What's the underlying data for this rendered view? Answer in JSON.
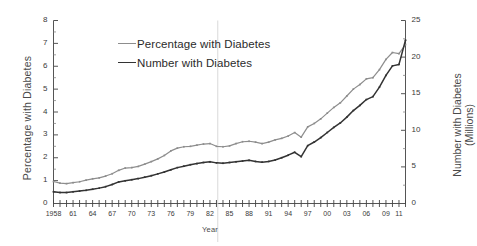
{
  "chart_data": {
    "type": "line",
    "title": "",
    "xlabel": "Year",
    "ylabel": "Percentage with Diabetes",
    "ylabel_right_line1": "Number with Diabetes",
    "ylabel_right_line2": "(Millions)",
    "ylim": [
      0,
      8
    ],
    "ylim_right": [
      0,
      25
    ],
    "xlim": [
      1958,
      2012
    ],
    "grid": false,
    "legend_position": "top-center",
    "y_ticks": [
      0,
      1,
      2,
      3,
      4,
      5,
      6,
      7,
      8
    ],
    "y_ticks_right": [
      0,
      5,
      10,
      15,
      20,
      25
    ],
    "x_tick_labels": [
      "1958",
      "61",
      "64",
      "67",
      "70",
      "73",
      "76",
      "79",
      "82",
      "85",
      "88",
      "91",
      "94",
      "97",
      "00",
      "03",
      "06",
      "09",
      "11"
    ],
    "x_tick_years": [
      1958,
      1961,
      1964,
      1967,
      1970,
      1973,
      1976,
      1979,
      1982,
      1985,
      1988,
      1991,
      1994,
      1997,
      2000,
      2003,
      2006,
      2009,
      2011
    ],
    "x": [
      1958,
      1959,
      1960,
      1961,
      1962,
      1963,
      1964,
      1965,
      1966,
      1967,
      1968,
      1969,
      1970,
      1971,
      1972,
      1973,
      1974,
      1975,
      1976,
      1977,
      1978,
      1979,
      1980,
      1981,
      1982,
      1983,
      1984,
      1985,
      1986,
      1987,
      1988,
      1989,
      1990,
      1991,
      1992,
      1993,
      1994,
      1995,
      1996,
      1997,
      1998,
      1999,
      2000,
      2001,
      2002,
      2003,
      2004,
      2005,
      2006,
      2007,
      2008,
      2009,
      2010,
      2011,
      2012
    ],
    "series": [
      {
        "name": "Percentage with Diabetes",
        "axis": "left",
        "units": "percent",
        "color": "#8d8d8d",
        "style": "line-with-markers",
        "values": [
          0.96,
          0.89,
          0.87,
          0.91,
          0.95,
          1.02,
          1.08,
          1.12,
          1.2,
          1.3,
          1.45,
          1.55,
          1.57,
          1.62,
          1.72,
          1.83,
          1.95,
          2.1,
          2.3,
          2.42,
          2.48,
          2.5,
          2.55,
          2.6,
          2.62,
          2.5,
          2.48,
          2.52,
          2.62,
          2.7,
          2.72,
          2.68,
          2.62,
          2.68,
          2.78,
          2.85,
          2.95,
          3.1,
          2.9,
          3.35,
          3.5,
          3.7,
          3.95,
          4.2,
          4.4,
          4.7,
          5.0,
          5.2,
          5.45,
          5.5,
          5.85,
          6.3,
          6.6,
          6.55,
          6.95
        ]
      },
      {
        "name": "Number with Diabetes",
        "axis": "right",
        "units": "millions",
        "color": "#333333",
        "style": "line-with-markers",
        "values": [
          1.6,
          1.5,
          1.5,
          1.6,
          1.7,
          1.8,
          1.95,
          2.1,
          2.3,
          2.6,
          2.95,
          3.1,
          3.25,
          3.4,
          3.6,
          3.8,
          4.05,
          4.3,
          4.6,
          4.9,
          5.1,
          5.3,
          5.45,
          5.6,
          5.7,
          5.55,
          5.5,
          5.6,
          5.7,
          5.8,
          5.9,
          5.75,
          5.65,
          5.75,
          5.95,
          6.25,
          6.6,
          7.0,
          6.4,
          7.9,
          8.4,
          9.0,
          9.7,
          10.4,
          11.0,
          11.8,
          12.7,
          13.4,
          14.2,
          14.6,
          15.9,
          17.5,
          18.8,
          19.0,
          22.3
        ]
      }
    ]
  },
  "legend": {
    "items": [
      {
        "label": "Percentage with Diabetes",
        "color": "#8d8d8d"
      },
      {
        "label": "Number with Diabetes",
        "color": "#333333"
      }
    ]
  }
}
